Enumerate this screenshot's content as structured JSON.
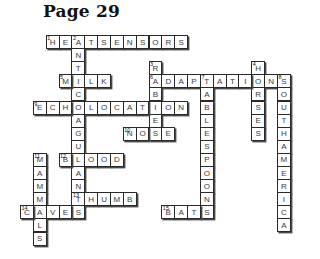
{
  "page": {
    "title": "Page 29"
  },
  "puzzle": {
    "cell_w": 12.85,
    "cell_h": 13.1,
    "origin_x": 20,
    "origin_y": 35,
    "words": [
      {
        "number": "1",
        "answer": "HEATSENSORS",
        "dir": "across",
        "row": 0,
        "col": 2
      },
      {
        "number": "2",
        "answer": "ANTICOAGULANTS",
        "dir": "down",
        "row": 0,
        "col": 4
      },
      {
        "number": "3",
        "answer": "RABIES",
        "dir": "down",
        "row": 2,
        "col": 10
      },
      {
        "number": "4",
        "answer": "HORSES",
        "dir": "down",
        "row": 2,
        "col": 18
      },
      {
        "number": "5",
        "answer": "MILK",
        "dir": "across",
        "row": 3,
        "col": 3
      },
      {
        "number": "6",
        "answer": "ADAPTATIONS",
        "dir": "across",
        "row": 3,
        "col": 10
      },
      {
        "number": "7",
        "answer": "TABLESPOONS",
        "dir": "down",
        "row": 3,
        "col": 14
      },
      {
        "number": "8",
        "answer": "SOUTHAMERICA",
        "dir": "down",
        "row": 3,
        "col": 20
      },
      {
        "number": "9",
        "answer": "ECHOLOCATION",
        "dir": "across",
        "row": 5,
        "col": 1
      },
      {
        "number": "10",
        "answer": "NOSE",
        "dir": "across",
        "row": 7,
        "col": 8
      },
      {
        "number": "11",
        "answer": "MAMMALS",
        "dir": "down",
        "row": 9,
        "col": 1
      },
      {
        "number": "12",
        "answer": "BLOOD",
        "dir": "across",
        "row": 9,
        "col": 3
      },
      {
        "number": "13",
        "answer": "THUMB",
        "dir": "across",
        "row": 12,
        "col": 4
      },
      {
        "number": "14",
        "answer": "CAVES",
        "dir": "across",
        "row": 13,
        "col": 0
      },
      {
        "number": "15",
        "answer": "BATS",
        "dir": "across",
        "row": 13,
        "col": 11
      }
    ]
  }
}
